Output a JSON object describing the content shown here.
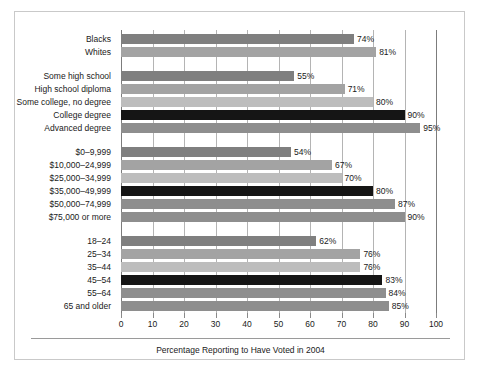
{
  "chart_data": {
    "type": "bar",
    "orientation": "horizontal",
    "title": "",
    "caption": "Percentage Reporting to Have Voted in 2004",
    "xlabel": "",
    "ylabel": "",
    "xlim": [
      0,
      100
    ],
    "xticks": [
      0,
      10,
      20,
      30,
      40,
      50,
      60,
      70,
      80,
      90,
      100
    ],
    "xtick_labels": [
      "0",
      "10",
      "20",
      "30",
      "40",
      "50",
      "60",
      "70",
      "80",
      "90",
      "100"
    ],
    "grid": true,
    "grid_axis": "x",
    "legend": "none",
    "value_suffix": "%",
    "groups": [
      {
        "name": "race",
        "categories": [
          "Blacks",
          "Whites"
        ],
        "values": [
          74,
          81
        ],
        "value_labels": [
          "74%",
          "81%"
        ],
        "colors": [
          "#7f7f7f",
          "#a3a3a3"
        ]
      },
      {
        "name": "education",
        "categories": [
          "Some high school",
          "High school diploma",
          "Some college, no degree",
          "College degree",
          "Advanced degree"
        ],
        "values": [
          55,
          71,
          80,
          90,
          95
        ],
        "value_labels": [
          "55%",
          "71%",
          "80%",
          "90%",
          "95%"
        ],
        "colors": [
          "#7f7f7f",
          "#a3a3a3",
          "#bdbdbd",
          "#151515",
          "#8e8e8e"
        ]
      },
      {
        "name": "income",
        "categories": [
          "$0–9,999",
          "$10,000–24,999",
          "$25,000–34,999",
          "$35,000–49,999",
          "$50,000–74,999",
          "$75,000 or more"
        ],
        "values": [
          54,
          67,
          70,
          80,
          87,
          90
        ],
        "value_labels": [
          "54%",
          "67%",
          "70%",
          "80%",
          "87%",
          "90%"
        ],
        "colors": [
          "#7f7f7f",
          "#a3a3a3",
          "#bdbdbd",
          "#151515",
          "#8e8e8e",
          "#8e8e8e"
        ]
      },
      {
        "name": "age",
        "categories": [
          "18–24",
          "25–34",
          "35–44",
          "45–54",
          "55–64",
          "65 and older"
        ],
        "values": [
          62,
          76,
          76,
          83,
          84,
          85
        ],
        "value_labels": [
          "62%",
          "76%",
          "76%",
          "83%",
          "84%",
          "85%"
        ],
        "colors": [
          "#7f7f7f",
          "#a3a3a3",
          "#bdbdbd",
          "#151515",
          "#8e8e8e",
          "#8e8e8e"
        ]
      }
    ]
  },
  "colors": {
    "bar_dark_gray": "#7f7f7f",
    "bar_mid_gray": "#a3a3a3",
    "bar_light_gray": "#bdbdbd",
    "bar_black": "#151515",
    "bar_medium_gray": "#8e8e8e",
    "gridline": "#b4b4b4",
    "axis": "#7c7c7c",
    "frame_border": "#c9c9c9",
    "text": "#1a1a1a",
    "background": "#ffffff"
  }
}
